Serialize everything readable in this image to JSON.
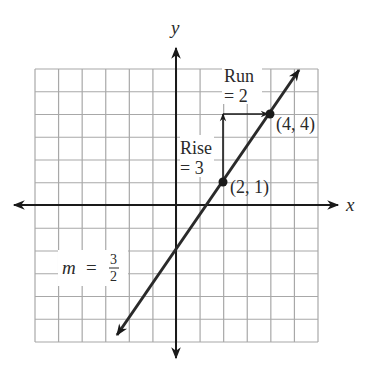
{
  "diagram": {
    "axes": {
      "x_label": "x",
      "y_label": "y"
    },
    "grid": {
      "x_min": -6,
      "x_max": 6,
      "y_min": -6,
      "y_max": 6
    },
    "line": {
      "slope_label_m": "m",
      "slope_label_eq": "=",
      "slope_num": "3",
      "slope_den": "2",
      "equation": "y = (3/2)x - 2"
    },
    "points": [
      {
        "label": "(2, 1)",
        "x": 2,
        "y": 1
      },
      {
        "label": "(4, 4)",
        "x": 4,
        "y": 4
      }
    ],
    "rise": {
      "line1": "Rise",
      "line2": "= 3"
    },
    "run": {
      "line1": "Run",
      "line2": "= 2"
    },
    "colors": {
      "grid": "#a8a8a8",
      "axis": "#1a1a1a",
      "line": "#2a2a2a",
      "text": "#2a2a2a"
    }
  }
}
